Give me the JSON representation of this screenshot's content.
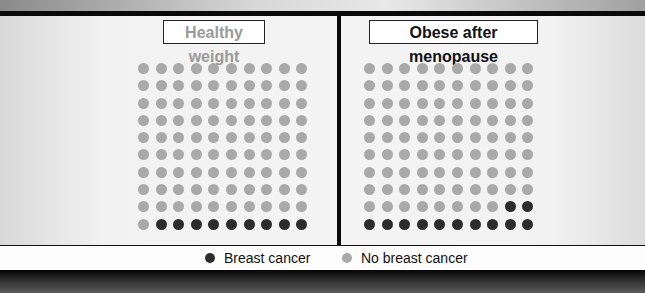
{
  "chart_data": {
    "type": "waffle",
    "title": "",
    "grid": {
      "rows": 10,
      "cols": 10,
      "total": 100
    },
    "panels": [
      {
        "label": "Healthy weight",
        "breast_cancer": 9,
        "no_breast_cancer": 91
      },
      {
        "label": "Obese after menopause",
        "breast_cancer": 12,
        "no_breast_cancer": 88
      }
    ],
    "legend": [
      {
        "label": "Breast cancer",
        "color": "#2c2c2c"
      },
      {
        "label": "No breast cancer",
        "color": "#a9a9a9"
      }
    ],
    "legend_position": "bottom"
  },
  "panels": {
    "left": {
      "title": "Healthy weight",
      "title_color": "#9a9a9a"
    },
    "right": {
      "title": "Obese after menopause",
      "title_color": "#111111"
    }
  },
  "legend": {
    "cancer_label": "Breast cancer",
    "no_cancer_label": "No breast cancer"
  },
  "colors": {
    "cancer": "#2c2c2c",
    "no_cancer": "#a9a9a9"
  }
}
